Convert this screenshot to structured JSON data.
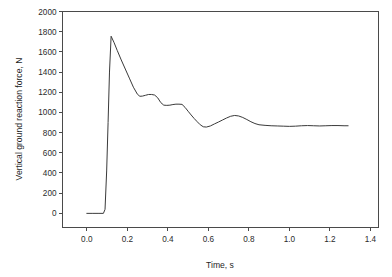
{
  "chart_data": {
    "type": "line",
    "title": "",
    "xlabel": "Time, s",
    "ylabel": "Vertical ground reaction force, N",
    "xlim": [
      -0.12,
      1.44
    ],
    "ylim": [
      -140,
      2000
    ],
    "xticks": [
      0.0,
      0.2,
      0.4,
      0.6,
      0.8,
      1.0,
      1.2,
      1.4
    ],
    "xticklabels": [
      "0.0",
      "0.2",
      "0.4",
      "0.6",
      "0.8",
      "1.0",
      "1.2",
      "1.4"
    ],
    "yticks": [
      0,
      200,
      400,
      600,
      800,
      1000,
      1200,
      1400,
      1600,
      1800,
      2000
    ],
    "yticklabels": [
      "0",
      "200",
      "400",
      "600",
      "800",
      "1000",
      "1200",
      "1400",
      "1600",
      "1800",
      "2000"
    ],
    "grid": false,
    "legend": null,
    "frame": "box",
    "series": [
      {
        "name": "vertical ground reaction force",
        "color": "#3a3a3a",
        "x": [
          0.0,
          0.03,
          0.06,
          0.082,
          0.09,
          0.098,
          0.105,
          0.112,
          0.12,
          0.135,
          0.15,
          0.17,
          0.19,
          0.21,
          0.23,
          0.25,
          0.262,
          0.275,
          0.29,
          0.305,
          0.32,
          0.335,
          0.35,
          0.365,
          0.38,
          0.395,
          0.41,
          0.425,
          0.44,
          0.455,
          0.47,
          0.485,
          0.5,
          0.515,
          0.53,
          0.545,
          0.56,
          0.575,
          0.59,
          0.61,
          0.63,
          0.65,
          0.67,
          0.69,
          0.71,
          0.73,
          0.75,
          0.77,
          0.79,
          0.81,
          0.83,
          0.85,
          0.88,
          0.91,
          0.94,
          0.97,
          1.0,
          1.03,
          1.06,
          1.09,
          1.12,
          1.15,
          1.18,
          1.21,
          1.24,
          1.27,
          1.29
        ],
        "y": [
          0,
          0,
          0,
          0,
          40,
          420,
          900,
          1400,
          1755,
          1690,
          1615,
          1520,
          1430,
          1340,
          1250,
          1180,
          1160,
          1162,
          1170,
          1178,
          1178,
          1172,
          1145,
          1098,
          1072,
          1070,
          1072,
          1078,
          1082,
          1082,
          1080,
          1050,
          1012,
          975,
          940,
          908,
          878,
          858,
          855,
          866,
          886,
          905,
          925,
          945,
          962,
          970,
          965,
          950,
          930,
          908,
          890,
          878,
          872,
          868,
          866,
          864,
          862,
          864,
          868,
          870,
          868,
          866,
          868,
          870,
          870,
          868,
          868
        ]
      }
    ]
  },
  "axis": {
    "y_title": "Vertical ground reaction force, N",
    "x_title": "Time, s"
  }
}
